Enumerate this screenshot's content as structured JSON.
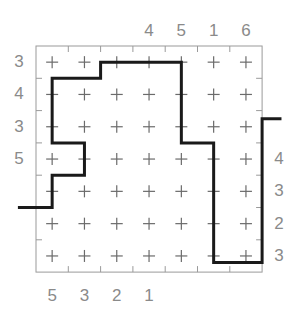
{
  "puzzle": {
    "title": "Grid Path Puzzle",
    "grid": {
      "cols": 7,
      "rows": 7,
      "origin_x": 36,
      "origin_y": 46,
      "cell": 32.3,
      "border_color": "#9a9a9a",
      "mark_color": "#6b6b6b",
      "mark_glyph": "+"
    },
    "path": {
      "color": "#1a1a1a",
      "width": 3,
      "points": [
        [
          -0.56,
          5.0
        ],
        [
          0.5,
          5.0
        ],
        [
          0.5,
          4.0
        ],
        [
          1.5,
          4.0
        ],
        [
          1.5,
          3.0
        ],
        [
          0.5,
          3.0
        ],
        [
          0.5,
          1.0
        ],
        [
          2.0,
          1.0
        ],
        [
          2.0,
          0.5
        ],
        [
          4.5,
          0.5
        ],
        [
          4.5,
          3.0
        ],
        [
          5.5,
          3.0
        ],
        [
          5.5,
          6.7
        ],
        [
          7.0,
          6.7
        ],
        [
          7.0,
          2.25
        ],
        [
          7.6,
          2.25
        ]
      ]
    },
    "labels": {
      "top": [
        {
          "text": "4",
          "col": 3
        },
        {
          "text": "5",
          "col": 4
        },
        {
          "text": "1",
          "col": 5
        },
        {
          "text": "6",
          "col": 6
        }
      ],
      "bottom": [
        {
          "text": "5",
          "col": 0
        },
        {
          "text": "3",
          "col": 1
        },
        {
          "text": "2",
          "col": 2
        },
        {
          "text": "1",
          "col": 3
        }
      ],
      "left": [
        {
          "text": "3",
          "row": 0
        },
        {
          "text": "4",
          "row": 1
        },
        {
          "text": "3",
          "row": 2
        },
        {
          "text": "5",
          "row": 3
        }
      ],
      "right": [
        {
          "text": "4",
          "row": 3
        },
        {
          "text": "3",
          "row": 4
        },
        {
          "text": "2",
          "row": 5
        },
        {
          "text": "3",
          "row": 6
        }
      ]
    }
  }
}
